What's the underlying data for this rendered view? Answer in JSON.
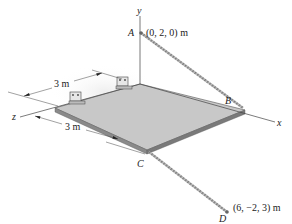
{
  "diagram": {
    "axes": {
      "x": "x",
      "y": "y",
      "z": "z"
    },
    "points": {
      "A": {
        "label": "A",
        "coords": "(0, 2, 0) m"
      },
      "B": {
        "label": "B"
      },
      "C": {
        "label": "C"
      },
      "D": {
        "label": "D",
        "coords": "(6, −2, 3) m"
      }
    },
    "dimensions": {
      "top": "3 m",
      "bottom": "3 m"
    },
    "colors": {
      "plate_top": "#c8c8c8",
      "plate_edge": "#7a7a7a",
      "line": "#333333",
      "cable": "#8a8a8a"
    }
  }
}
